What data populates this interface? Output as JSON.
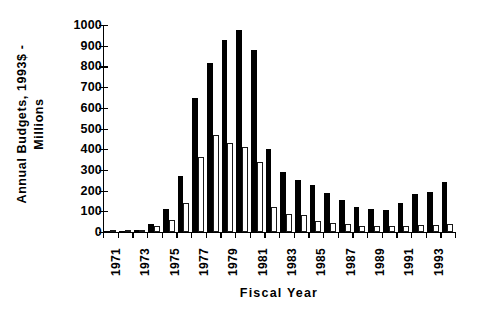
{
  "chart_data": {
    "type": "bar",
    "title": "",
    "xlabel": "Fiscal  Year",
    "ylabel": "Annual  Budgets,  1993$  -\nMillions",
    "ylim": [
      0,
      1000
    ],
    "ytick_values": [
      0,
      100,
      200,
      300,
      400,
      500,
      600,
      700,
      800,
      900,
      1000
    ],
    "ytick_labels": [
      "0",
      "100",
      "200",
      "300",
      "400",
      "500",
      "600",
      "700",
      "800",
      "900",
      "1000"
    ],
    "categories": [
      "1971",
      "1972",
      "1973",
      "1974",
      "1975",
      "1976",
      "1977",
      "1978",
      "1979",
      "1980",
      "1981",
      "1982",
      "1983",
      "1984",
      "1985",
      "1986",
      "1987",
      "1988",
      "1989",
      "1990",
      "1991",
      "1992",
      "1993",
      "1994"
    ],
    "xtick_labels": [
      "1971",
      "",
      "1973",
      "",
      "1975",
      "",
      "1977",
      "",
      "1979",
      "",
      "1981",
      "",
      "1983",
      "",
      "1985",
      "",
      "1987",
      "",
      "1989",
      "",
      "1991",
      "",
      "1993",
      ""
    ],
    "grid": false,
    "legend": "none",
    "series": [
      {
        "name": "Total Budget",
        "color": "#000000",
        "style": "filled",
        "values": [
          2,
          4,
          9,
          39,
          110,
          272,
          648,
          816,
          926,
          975,
          877,
          402,
          288,
          250,
          228,
          188,
          156,
          119,
          109,
          106,
          141,
          184,
          194,
          242
        ]
      },
      {
        "name": "Subcomponent Budget",
        "color": "#ffffff",
        "style": "outlined",
        "values": [
          1,
          2,
          5,
          27,
          60,
          139,
          363,
          471,
          430,
          411,
          339,
          119,
          88,
          84,
          55,
          45,
          37,
          30,
          31,
          28,
          31,
          36,
          32,
          37
        ]
      }
    ]
  }
}
